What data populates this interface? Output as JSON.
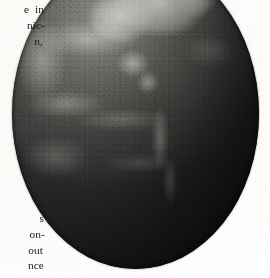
{
  "page": {
    "kind": "scanned-book-page",
    "background_color": "#fdfdfc",
    "width": 270,
    "height": 278
  },
  "margin_text": {
    "top_block": {
      "lines": [
        "e  in",
        "nic-",
        "n,"
      ]
    },
    "bottom_block": {
      "lines": [
        "s",
        "on-",
        "out",
        "nce"
      ]
    },
    "ink_color": "#1c1a18"
  },
  "figure": {
    "name": "earth-photograph",
    "visible_features": [
      "North America",
      "Central America",
      "South America",
      "Greenland",
      "Pacific Ocean",
      "Atlantic Ocean",
      "cloud bands"
    ],
    "rendering": "grayscale halftone photograph",
    "cropped_edges": [
      "top",
      "right"
    ],
    "colors": {
      "highlight": "#e2e0d8",
      "midtone": "#6a6863",
      "shadow": "#2e2d2b",
      "limb": "#1a1a18"
    }
  }
}
